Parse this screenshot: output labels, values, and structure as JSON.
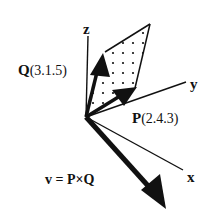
{
  "diagram": {
    "type": "3d-vector-cross-product",
    "axes": {
      "x": {
        "label": "x"
      },
      "y": {
        "label": "y"
      },
      "z": {
        "label": "z"
      }
    },
    "vectors": {
      "Q": {
        "name": "Q",
        "coords": "(3.1.5)"
      },
      "P": {
        "name": "P",
        "coords": "(2.4.3)"
      },
      "v": {
        "equation": "v = P×Q"
      }
    },
    "colors": {
      "ink": "#111111",
      "background": "#ffffff"
    }
  }
}
